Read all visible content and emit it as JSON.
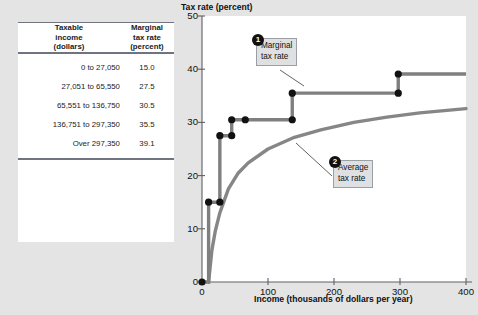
{
  "table": {
    "headers": [
      {
        "line1": "Taxable",
        "line2": "income",
        "line3": "(dollars)"
      },
      {
        "line1": "Marginal",
        "line2": "tax rate",
        "line3": "(percent)"
      }
    ],
    "rows": [
      {
        "income": "0 to 27,050",
        "rate": "15.0"
      },
      {
        "income": "27,051 to 65,550",
        "rate": "27.5"
      },
      {
        "income": "65,551 to 136,750",
        "rate": "30.5"
      },
      {
        "income": "136,751 to 297,350",
        "rate": "35.5"
      },
      {
        "income": "Over 297,350",
        "rate": "39.1"
      }
    ]
  },
  "callouts": [
    {
      "badge": "1",
      "line1": "Marginal",
      "line2": "tax rate"
    },
    {
      "badge": "2",
      "line1": "Average",
      "line2": "tax rate"
    }
  ],
  "chart_data": {
    "type": "line",
    "title": "",
    "xlabel": "Income (thousands of dollars per year)",
    "ylabel": "Tax rate (percent)",
    "xlim": [
      0,
      400
    ],
    "ylim": [
      0,
      50
    ],
    "xticks": [
      0,
      100,
      200,
      300,
      400
    ],
    "yticks": [
      0,
      10,
      20,
      30,
      40,
      50
    ],
    "xtick_labels": [
      "0",
      "100",
      "200",
      "300",
      "400"
    ],
    "ytick_labels": [
      "0",
      "10",
      "20",
      "30",
      "40",
      "50"
    ],
    "grid": false,
    "legend": "annotations",
    "line_color": "#808080",
    "marker_color": "#111111",
    "series": [
      {
        "name": "Marginal tax rate",
        "style": "step",
        "brackets": [
          {
            "x_start": 0,
            "x_end": 27.05,
            "rate": 15.0
          },
          {
            "x_start": 27.05,
            "x_end": 65.55,
            "rate": 27.5
          },
          {
            "x_start": 65.55,
            "x_end": 136.75,
            "rate": 30.5
          },
          {
            "x_start": 136.75,
            "x_end": 297.35,
            "rate": 35.5
          },
          {
            "x_start": 297.35,
            "x_end": 400,
            "rate": 39.1
          }
        ],
        "markers": [
          {
            "x": 0,
            "y": 0
          },
          {
            "x": 10,
            "y": 15.0
          },
          {
            "x": 27.05,
            "y": 15.0
          },
          {
            "x": 27.05,
            "y": 27.5
          },
          {
            "x": 45,
            "y": 27.5
          },
          {
            "x": 45,
            "y": 30.5
          },
          {
            "x": 65.55,
            "y": 30.5
          },
          {
            "x": 136.75,
            "y": 30.5
          },
          {
            "x": 136.75,
            "y": 35.5
          },
          {
            "x": 297.35,
            "y": 35.5
          },
          {
            "x": 297.35,
            "y": 39.1
          }
        ]
      },
      {
        "name": "Average tax rate",
        "style": "smooth",
        "points": [
          {
            "x": 10,
            "y": 0
          },
          {
            "x": 15,
            "y": 6.0
          },
          {
            "x": 20,
            "y": 9.5
          },
          {
            "x": 27,
            "y": 13.0
          },
          {
            "x": 40,
            "y": 17.5
          },
          {
            "x": 55,
            "y": 20.5
          },
          {
            "x": 70,
            "y": 22.4
          },
          {
            "x": 100,
            "y": 25.0
          },
          {
            "x": 140,
            "y": 27.2
          },
          {
            "x": 180,
            "y": 28.6
          },
          {
            "x": 230,
            "y": 30.0
          },
          {
            "x": 280,
            "y": 31.0
          },
          {
            "x": 330,
            "y": 31.8
          },
          {
            "x": 400,
            "y": 32.6
          }
        ]
      }
    ]
  }
}
